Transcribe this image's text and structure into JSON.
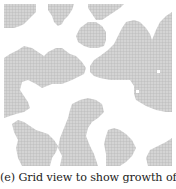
{
  "figure": {
    "caption": "(e) Grid view to show growth of mu-",
    "grid_view": {
      "cell_size_px": 3,
      "cell_fill": "#d4d4d4",
      "cell_line": "#b5b5b5",
      "background": "#ffffff",
      "regions": [
        {
          "name": "top-left-blob",
          "points": "4,4 36,4 36,12 32,16 28,20 24,24 20,26 14,28 8,28 4,28"
        },
        {
          "name": "top-center-blob",
          "points": "48,4 74,4 72,10 68,16 64,20 62,24 58,26 54,22 52,16 48,10"
        },
        {
          "name": "top-right-small-blob",
          "points": "88,4 124,4 120,8 114,12 108,16 102,20 96,20 92,14 88,8"
        },
        {
          "name": "mid-top-blob",
          "points": "80,28 88,22 96,22 102,26 106,32 106,40 104,46 98,48 90,48 84,46 78,42 76,36"
        },
        {
          "name": "right-large-blob",
          "points": "126,22 134,20 140,22 146,28 150,34 152,40 156,30 160,22 166,16 172,12 172,112 166,112 156,110 146,106 136,100 134,94 134,86 130,80 120,80 110,80 100,78 94,76 90,72 90,66 94,60 100,56 108,50 114,44 118,36 122,28"
        },
        {
          "name": "left-large-blob",
          "points": "4,58 10,54 18,50 24,46 32,48 38,52 44,56 48,52 56,48 62,48 70,54 76,56 82,62 86,68 84,74 80,76 72,80 62,84 52,84 42,88 36,84 28,80 22,82 20,90 24,96 28,102 30,108 24,112 16,114 10,116 4,118"
        },
        {
          "name": "center-bottom-blob",
          "points": "72,104 80,100 88,98 96,100 102,104 104,112 98,118 92,122 88,128 86,136 90,146 94,154 98,166 60,166 62,156 58,148 60,138 64,128 68,118 70,110"
        },
        {
          "name": "left-bottom-blob",
          "points": "12,124 18,120 24,122 30,126 36,130 42,132 48,134 54,140 58,146 56,152 52,158 50,166 22,166 18,158 16,148 18,140 14,132"
        },
        {
          "name": "right-bottom-blob",
          "points": "108,130 114,128 120,130 126,134 132,140 136,148 132,156 126,162 120,166 106,166 106,154 104,144 106,136"
        },
        {
          "name": "bottom-right-corner-blob",
          "points": "150,150 158,146 166,142 172,138 172,166 148,166 146,158"
        }
      ],
      "holes": [
        {
          "name": "small-hole-1",
          "x": 157,
          "y": 70,
          "w": 3,
          "h": 3
        },
        {
          "name": "small-hole-2",
          "x": 136,
          "y": 90,
          "w": 3,
          "h": 3
        }
      ]
    }
  }
}
